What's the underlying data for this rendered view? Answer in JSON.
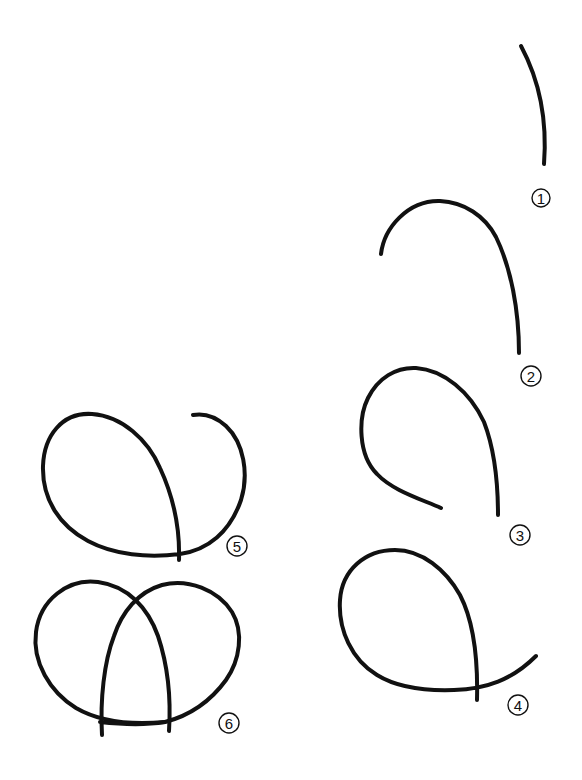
{
  "diagram": {
    "type": "step-by-step drawing tutorial",
    "background_color": "#ffffff",
    "stroke_color": "#111111",
    "steps": [
      {
        "number": "1",
        "label_position": [
          541,
          198
        ],
        "description": "Single gently curved stroke"
      },
      {
        "number": "2",
        "label_position": [
          531,
          376
        ],
        "description": "Hook-shaped arch curving down to the right"
      },
      {
        "number": "3",
        "label_position": [
          520,
          535
        ],
        "description": "Open teardrop loop"
      },
      {
        "number": "4",
        "label_position": [
          518,
          705
        ],
        "description": "Closed teardrop loop with a tail sweeping right"
      },
      {
        "number": "5",
        "label_position": [
          237,
          546
        ],
        "description": "Left lobe with right lobe hook starting"
      },
      {
        "number": "6",
        "label_position": [
          229,
          723
        ],
        "description": "Completed shape with two overlapping lobes"
      }
    ]
  }
}
